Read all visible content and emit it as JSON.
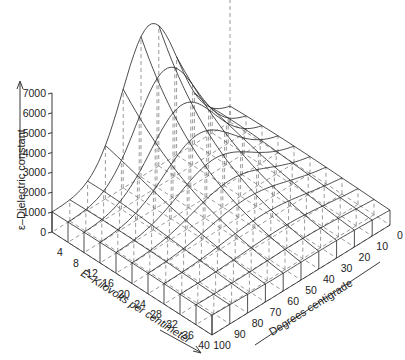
{
  "chart_data": {
    "type": "surface3d",
    "title": "",
    "zlabel": "ε–Dielectric constant",
    "xlabel": "E–Kilovolts per centimeter",
    "ylabel": "Degrees centigrade",
    "z_ticks": [
      "0",
      "1000",
      "2000",
      "3000",
      "4000",
      "5000",
      "6000",
      "7000"
    ],
    "e_ticks": [
      "4",
      "8",
      "12",
      "16",
      "20",
      "24",
      "28",
      "32",
      "36",
      "40"
    ],
    "t_ticks": [
      "0",
      "10",
      "20",
      "30",
      "40",
      "50",
      "60",
      "70",
      "80",
      "90",
      "100"
    ],
    "zlim": [
      0,
      7000
    ],
    "e_range": [
      0,
      40
    ],
    "t_range": [
      0,
      100
    ],
    "e_values": [
      0,
      4,
      8,
      12,
      16,
      20,
      24,
      28,
      32,
      36,
      40
    ],
    "t_values": [
      0,
      10,
      20,
      30,
      40,
      50,
      60,
      70,
      80,
      90,
      100
    ],
    "surface_description": "Dielectric constant peaks near 7000 at low field (E≈0) around 40–50 °C, falling toward ≈1000–1500 at high field (E=40) and at the temperature extremes.",
    "grid": true
  },
  "labels": {
    "z_axis_title": "ε–Dielectric constant",
    "e_axis_title": "E–Kilovolts per centimeter",
    "t_axis_title": "Degrees centigrade"
  }
}
